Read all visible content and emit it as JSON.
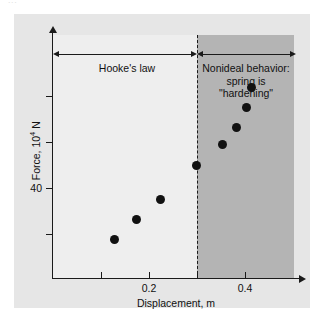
{
  "top_scrap_text": "...",
  "figure": {
    "shade_color": "#b4b4b4",
    "panel_color": "#eeeeee",
    "background_color": "#e6e6e6",
    "marker_color": "#111111"
  },
  "annotations": {
    "hooke_label": "Hooke's law",
    "nonideal_line1": "Nonideal behavior:",
    "nonideal_line2": "spring is",
    "nonideal_line3": "\"hardening\"",
    "divider_x": 0.34
  },
  "chart_data": {
    "type": "scatter",
    "title": "",
    "xlabel": "Displacement, m",
    "ylabel": "Force, 10⁴ N",
    "ylabel_base": "Force, 10",
    "ylabel_exp": "4",
    "ylabel_unit": " N",
    "xlim": [
      0.0,
      0.5
    ],
    "ylim": [
      20,
      60
    ],
    "xticks": [
      0.1,
      0.2,
      0.3,
      0.4
    ],
    "xtick_labels": [
      "",
      "0.2",
      "",
      "0.4"
    ],
    "yticks": [
      30,
      35,
      40,
      45,
      50
    ],
    "ytick_labels": [
      "",
      "",
      "40",
      "",
      ""
    ],
    "grid": false,
    "legend": false,
    "x": [
      0.13,
      0.175,
      0.225,
      0.3,
      0.355,
      0.385,
      0.405,
      0.415
    ],
    "y": [
      27.0,
      30.5,
      34.0,
      40.0,
      43.5,
      46.5,
      50.0,
      53.5
    ],
    "points": [
      {
        "x": 0.13,
        "y": 27.0
      },
      {
        "x": 0.175,
        "y": 30.5
      },
      {
        "x": 0.225,
        "y": 34.0
      },
      {
        "x": 0.3,
        "y": 40.0
      },
      {
        "x": 0.355,
        "y": 43.5
      },
      {
        "x": 0.385,
        "y": 46.5
      },
      {
        "x": 0.405,
        "y": 50.0
      },
      {
        "x": 0.415,
        "y": 53.5
      }
    ]
  }
}
